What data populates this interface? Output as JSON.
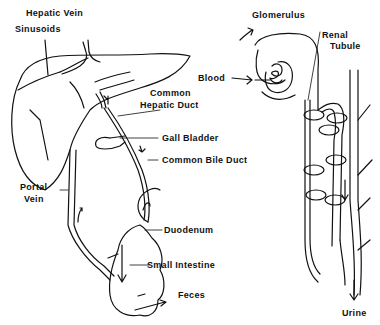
{
  "diagram": {
    "liver_panel": {
      "labels": {
        "hepatic_vein": "Hepatic Vein",
        "sinusoids": "Sinusoids",
        "common_hepatic_duct_line1": "Common",
        "common_hepatic_duct_line2": "Hepatic Duct",
        "gall_bladder": "Gall Bladder",
        "common_bile_duct": "Common Bile Duct",
        "portal_vein_line1": "Portal",
        "portal_vein_line2": "Vein",
        "duodenum": "Duodenum",
        "small_intestine": "Small Intestine",
        "feces": "Feces"
      }
    },
    "kidney_panel": {
      "labels": {
        "glomerulus": "Glomerulus",
        "renal_tubule_line1": "Renal",
        "renal_tubule_line2": "Tubule",
        "blood": "Blood",
        "urine": "Urine"
      }
    },
    "colors": {
      "line": "#111111",
      "background": "#ffffff"
    }
  }
}
